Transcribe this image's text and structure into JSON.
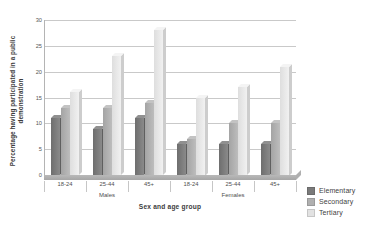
{
  "chart_data": {
    "type": "bar",
    "title": "",
    "xlabel": "Sex and age group",
    "ylabel": "Percentage having participated in a public demonstration",
    "ylim": [
      0,
      30
    ],
    "yticks": [
      0,
      5,
      10,
      15,
      20,
      25,
      30
    ],
    "grid": true,
    "legend_position": "right",
    "categories": [
      "18-24",
      "25-44",
      "45+",
      "18-24",
      "25-44",
      "45+"
    ],
    "supercategories": [
      {
        "label": "Males",
        "span": 3
      },
      {
        "label": "Females",
        "span": 3
      }
    ],
    "series": [
      {
        "name": "Elementary",
        "color": "#7a7a7a",
        "values": [
          11,
          9,
          11,
          6,
          6,
          6
        ]
      },
      {
        "name": "Secondary",
        "color": "#b0b0b0",
        "values": [
          13,
          13,
          14,
          7,
          10,
          10
        ]
      },
      {
        "name": "Tertiary",
        "color": "#e8e8e8",
        "values": [
          16,
          23,
          28,
          15,
          17,
          21
        ]
      }
    ]
  },
  "axes": {
    "y_title": "Percentage having participated in a public demonstration",
    "x_title": "Sex and age group",
    "y_tick_labels": [
      "30",
      "25",
      "20",
      "15",
      "10",
      "5",
      "0"
    ]
  },
  "legend": {
    "items": [
      {
        "label": "Elementary",
        "color": "#7a7a7a"
      },
      {
        "label": "Secondary",
        "color": "#b0b0b0"
      },
      {
        "label": "Tertiary",
        "color": "#e2e2e2"
      }
    ]
  }
}
